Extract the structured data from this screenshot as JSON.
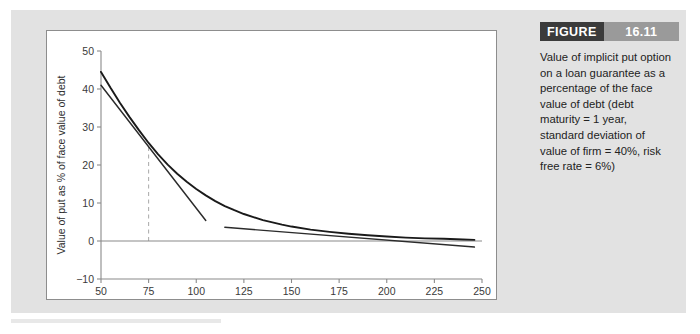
{
  "figure": {
    "tag_word": "FIGURE",
    "tag_number": "16.11",
    "caption": "Value of implicit put option on a loan guarantee as a percentage of the face value of debt (debt maturity = 1 year, standard deviation of value of firm = 40%, risk free rate = 6%)"
  },
  "colors": {
    "card_background": "#e2e2e2",
    "panel_background": "#ffffff",
    "panel_border": "#8d8d8d",
    "curve": "#1a1a1a",
    "tangent": "#2b2b2b",
    "axis": "#8a8a8a",
    "dashed_guide": "#a8a8a8",
    "tag_word_background": "#3b3b3b",
    "tag_number_background": "#9a9a9a",
    "text": "#232323"
  },
  "chart_data": {
    "type": "line",
    "title": "",
    "xlabel": "Firm value as % of face value of debt",
    "ylabel": "Value of put as % of face value of debt",
    "xlim": [
      50,
      250
    ],
    "ylim": [
      -10,
      50
    ],
    "xticks": [
      50,
      75,
      100,
      125,
      150,
      175,
      200,
      225,
      250
    ],
    "yticks": [
      -10,
      0,
      10,
      20,
      30,
      40,
      50
    ],
    "grid": false,
    "legend": null,
    "series": [
      {
        "name": "Put value curve",
        "role": "main-curve",
        "x": [
          50,
          55,
          60,
          65,
          70,
          75,
          80,
          85,
          90,
          95,
          100,
          105,
          110,
          115,
          120,
          125,
          130,
          135,
          140,
          145,
          150,
          160,
          170,
          180,
          190,
          200,
          210,
          220,
          230,
          240,
          246
        ],
        "y": [
          44.5,
          40.3,
          36.3,
          32.6,
          29.1,
          25.8,
          22.8,
          20.1,
          17.7,
          15.6,
          13.7,
          12.0,
          10.5,
          9.2,
          8.1,
          7.1,
          6.3,
          5.5,
          4.9,
          4.3,
          3.8,
          3.0,
          2.4,
          1.9,
          1.5,
          1.2,
          0.9,
          0.7,
          0.6,
          0.4,
          0.3
        ]
      },
      {
        "name": "Tangent line at firm value 75",
        "role": "tangent-1",
        "x": [
          50,
          105
        ],
        "y": [
          41.0,
          5.4
        ]
      },
      {
        "name": "Tangent line at firm value 175",
        "role": "tangent-2",
        "x": [
          115,
          246
        ],
        "y": [
          3.6,
          -1.6
        ]
      }
    ],
    "annotations": [
      {
        "name": "dashed-guide-at-75",
        "type": "vertical-dashed-line",
        "x": 75,
        "y_from": 0,
        "y_to": 25.8
      },
      {
        "name": "zero-line",
        "type": "horizontal-line",
        "y": 0
      }
    ]
  }
}
